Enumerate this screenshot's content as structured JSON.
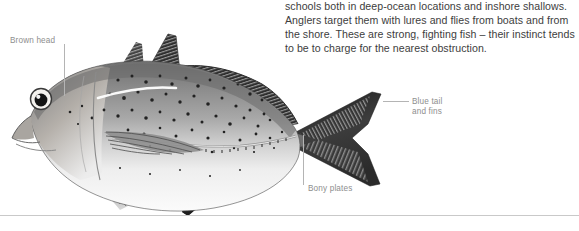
{
  "page": {
    "background_color": "#ffffff",
    "width": 579,
    "height": 231
  },
  "body_copy": {
    "text_color": "#3d3d3d",
    "lines": [
      "schools both in deep-ocean locations and inshore shallows.",
      "Anglers target them with lures and flies from boats and from",
      "the shore. These are strong, fighting fish – their instinct tends",
      "to be to charge for the nearest obstruction."
    ]
  },
  "illustration": {
    "name": "trevally-fish-illustration",
    "alt": "Grayscale illustration of a trevally fish facing left",
    "callouts": [
      {
        "id": "brown-head",
        "label": "Brown head"
      },
      {
        "id": "blue-tail",
        "label_line1": "Blue tail",
        "label_line2": "and fins"
      },
      {
        "id": "bony-plates",
        "label": "Bony plates"
      }
    ],
    "label_color": "#8e8e8e",
    "leader_color": "#b4b4b4"
  },
  "rule": {
    "color": "#c9c9c9"
  }
}
